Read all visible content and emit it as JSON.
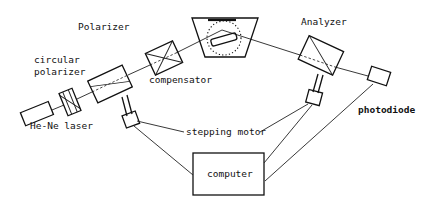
{
  "diagram": {
    "labels": {
      "polarizer": "Polarizer",
      "circular_polarizer_line1": "circular",
      "circular_polarizer_line2": "polarizer",
      "compensator": "compensator",
      "analyzer": "Analyzer",
      "laser": "He-Ne laser",
      "stepping_motor": "stepping motor",
      "photodiode": "photodiode",
      "computer": "computer"
    },
    "components": [
      {
        "id": "laser",
        "name": "He-Ne laser"
      },
      {
        "id": "circular-polarizer",
        "name": "circular polarizer"
      },
      {
        "id": "polarizer",
        "name": "Polarizer"
      },
      {
        "id": "compensator",
        "name": "compensator"
      },
      {
        "id": "sample-cell",
        "name": "sample"
      },
      {
        "id": "analyzer",
        "name": "Analyzer"
      },
      {
        "id": "photodiode",
        "name": "photodiode"
      },
      {
        "id": "stepping-motor-polarizer",
        "name": "stepping motor"
      },
      {
        "id": "stepping-motor-analyzer",
        "name": "stepping motor"
      },
      {
        "id": "computer",
        "name": "computer"
      }
    ],
    "connections": [
      {
        "from": "laser",
        "to": "circular-polarizer",
        "kind": "beam"
      },
      {
        "from": "circular-polarizer",
        "to": "polarizer",
        "kind": "beam"
      },
      {
        "from": "polarizer",
        "to": "compensator",
        "kind": "beam"
      },
      {
        "from": "compensator",
        "to": "sample-cell",
        "kind": "beam"
      },
      {
        "from": "sample-cell",
        "to": "analyzer",
        "kind": "beam"
      },
      {
        "from": "analyzer",
        "to": "photodiode",
        "kind": "beam"
      },
      {
        "from": "polarizer",
        "to": "stepping-motor-polarizer",
        "kind": "shaft"
      },
      {
        "from": "analyzer",
        "to": "stepping-motor-analyzer",
        "kind": "shaft"
      },
      {
        "from": "stepping-motor-polarizer",
        "to": "computer",
        "kind": "wire"
      },
      {
        "from": "stepping-motor-analyzer",
        "to": "computer",
        "kind": "wire"
      },
      {
        "from": "photodiode",
        "to": "computer",
        "kind": "wire"
      }
    ]
  }
}
